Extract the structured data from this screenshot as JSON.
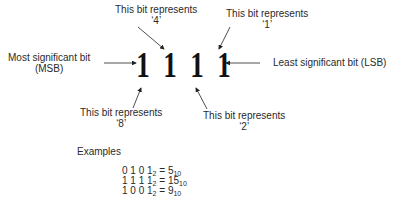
{
  "labels": {
    "bit4": [
      "This bit represents",
      "‘4’"
    ],
    "bit1": [
      "This bit represents",
      "‘1’"
    ],
    "bit8": [
      "This bit represents",
      "‘8’"
    ],
    "bit2": [
      "This bit represents",
      "‘2’"
    ],
    "msb": [
      "Most significant bit",
      "(MSB)"
    ],
    "lsb": "Least significant bit (LSB)"
  },
  "bits": [
    "1",
    "1",
    "1",
    "1"
  ],
  "examples": {
    "title": "Examples",
    "rows": [
      {
        "binary": "0 1 0 1",
        "base_in": "2",
        "equals": " = ",
        "decimal": "5",
        "base_out": "10"
      },
      {
        "binary": "1 1 1 1",
        "base_in": "2",
        "equals": " = ",
        "decimal": "15",
        "base_out": "10"
      },
      {
        "binary": "1 0 0 1",
        "base_in": "2",
        "equals": " = ",
        "decimal": "9",
        "base_out": "10"
      }
    ]
  }
}
